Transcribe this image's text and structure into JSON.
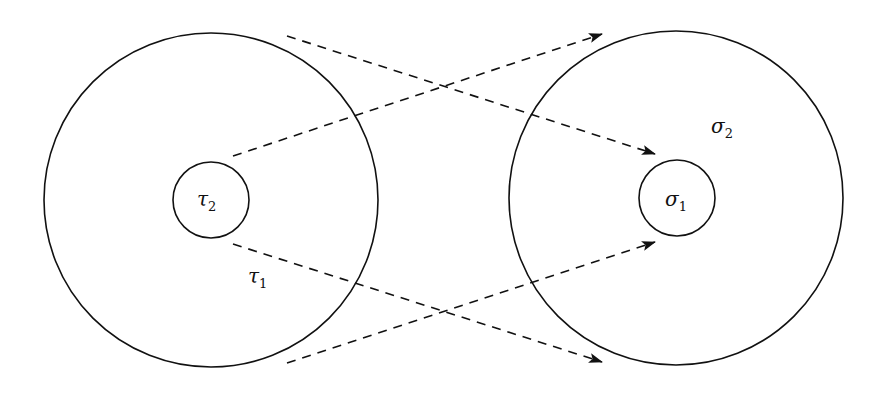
{
  "diagram": {
    "stroke_color": "#111111",
    "background": "#ffffff",
    "left": {
      "outer": {
        "symbol": "τ",
        "subscript": "1",
        "cx": 211,
        "cy": 200,
        "r": 167,
        "label_x": 248,
        "label_y": 283
      },
      "inner": {
        "symbol": "τ",
        "subscript": "2",
        "cx": 211,
        "cy": 200,
        "r": 38,
        "label_x": 197,
        "label_y": 206
      }
    },
    "right": {
      "outer": {
        "symbol": "σ",
        "subscript": "2",
        "cx": 676,
        "cy": 198,
        "r": 167,
        "label_x": 711,
        "label_y": 133
      },
      "inner": {
        "symbol": "σ",
        "subscript": "1",
        "cx": 677,
        "cy": 198,
        "r": 38,
        "label_x": 665,
        "label_y": 206
      }
    },
    "arrows": [
      {
        "id": "outer-left-top-to-inner-right",
        "x1": 287,
        "y1": 36,
        "x2": 655,
        "y2": 154
      },
      {
        "id": "inner-left-to-outer-right-top",
        "x1": 233,
        "y1": 156,
        "x2": 602,
        "y2": 34
      },
      {
        "id": "inner-left-to-outer-right-bottom",
        "x1": 233,
        "y1": 244,
        "x2": 602,
        "y2": 362
      },
      {
        "id": "outer-left-bottom-to-inner-right",
        "x1": 287,
        "y1": 363,
        "x2": 655,
        "y2": 242
      }
    ]
  }
}
